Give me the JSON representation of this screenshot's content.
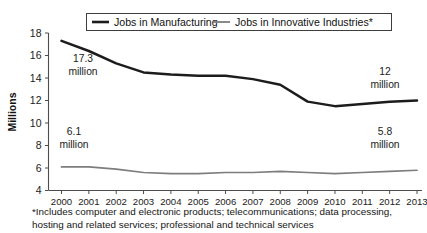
{
  "chart_data": {
    "type": "line",
    "title": "",
    "xlabel": "",
    "ylabel": "Millions",
    "ylim": [
      4,
      18
    ],
    "ytick_step": 2,
    "yticks": [
      "18",
      "16",
      "14",
      "12",
      "10",
      "8",
      "6",
      "4"
    ],
    "grid": false,
    "legend_position": "top",
    "x": [
      2000,
      2001,
      2002,
      2003,
      2004,
      2005,
      2006,
      2007,
      2008,
      2009,
      2010,
      2011,
      2012,
      2013
    ],
    "categories": [
      "2000",
      "2001",
      "2002",
      "2003",
      "2004",
      "2005",
      "2006",
      "2007",
      "2008",
      "2009",
      "2010",
      "2011",
      "2012",
      "2013"
    ],
    "series": [
      {
        "name": "Jobs in Manufacturing",
        "color": "#1c1c1c",
        "values": [
          17.3,
          16.4,
          15.3,
          14.5,
          14.3,
          14.2,
          14.2,
          13.9,
          13.4,
          11.9,
          11.5,
          11.7,
          11.9,
          12.0
        ]
      },
      {
        "name": "Jobs in Innovative Industries*",
        "color": "#7d7d7d",
        "values": [
          6.1,
          6.1,
          5.9,
          5.6,
          5.5,
          5.5,
          5.6,
          5.6,
          5.7,
          5.6,
          5.5,
          5.6,
          5.7,
          5.8
        ]
      }
    ],
    "annotations": [
      {
        "value": "17.3",
        "unit": "million",
        "series": "Jobs in Manufacturing",
        "at_year": 2000
      },
      {
        "value": "12",
        "unit": "million",
        "series": "Jobs in Manufacturing",
        "at_year": 2013
      },
      {
        "value": "6.1",
        "unit": "million",
        "series": "Jobs in Innovative Industries*",
        "at_year": 2000
      },
      {
        "value": "5.8",
        "unit": "million",
        "series": "Jobs in Innovative Industries*",
        "at_year": 2013
      }
    ]
  },
  "legend": {
    "items": [
      {
        "label": "Jobs in Manufacturing"
      },
      {
        "label": "Jobs in Innovative Industries*"
      }
    ]
  },
  "axis": {
    "y_title": "Millions",
    "y_labels": [
      "18",
      "16",
      "14",
      "12",
      "10",
      "8",
      "6",
      "4"
    ],
    "x_labels": [
      "2000",
      "2001",
      "2002",
      "2003",
      "2004",
      "2005",
      "2006",
      "2007",
      "2008",
      "2009",
      "2010",
      "2011",
      "2012",
      "2013"
    ]
  },
  "annotations": {
    "manufacturing_start_value": "17.3",
    "manufacturing_start_unit": "million",
    "manufacturing_end_value": "12",
    "manufacturing_end_unit": "million",
    "innovative_start_value": "6.1",
    "innovative_start_unit": "million",
    "innovative_end_value": "5.8",
    "innovative_end_unit": "million"
  },
  "footnote": {
    "line1": "*Includes computer and electronic products; telecommunications; data processing,",
    "line2": "hosting and related services; professional and technical services"
  },
  "colors": {
    "manufacturing": "#1c1c1c",
    "innovative": "#7d7d7d",
    "axis": "#4d4d4d",
    "text": "#1a1a1a",
    "background": "#ffffff"
  }
}
